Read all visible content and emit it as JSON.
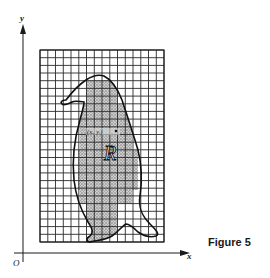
{
  "figure": {
    "caption": "Figure 5",
    "axes": {
      "x_label": "x",
      "y_label": "y",
      "origin_label": "O"
    },
    "region_label": "R",
    "point_label": "(xᵢ, yᵢ)",
    "grid": {
      "x_start": 40,
      "x_end": 164,
      "y_start": 50,
      "y_end": 242,
      "cell_size": 7.75
    },
    "colors": {
      "ink": "#1a1a1a",
      "shading": "#9a9a9a",
      "background": "#ffffff"
    }
  }
}
